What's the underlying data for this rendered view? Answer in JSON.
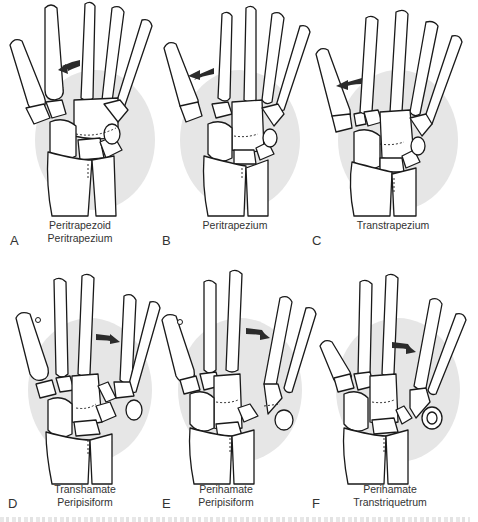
{
  "figure": {
    "panels": [
      {
        "id": "A",
        "letter": "A",
        "caption_line1": "Peritrapezoid",
        "caption_line2": "Peritrapezium",
        "arrow_direction": "left"
      },
      {
        "id": "B",
        "letter": "B",
        "caption_line1": "Peritrapezium",
        "caption_line2": "",
        "arrow_direction": "left"
      },
      {
        "id": "C",
        "letter": "C",
        "caption_line1": "Transtrapezium",
        "caption_line2": "",
        "arrow_direction": "left"
      },
      {
        "id": "D",
        "letter": "D",
        "caption_line1": "Transhamate",
        "caption_line2": "Peripisiform",
        "arrow_direction": "right"
      },
      {
        "id": "E",
        "letter": "E",
        "caption_line1": "Perihamate",
        "caption_line2": "Peripisiform",
        "arrow_direction": "right"
      },
      {
        "id": "F",
        "letter": "F",
        "caption_line1": "Perihamate",
        "caption_line2": "Transtriquetrum",
        "arrow_direction": "right"
      }
    ]
  },
  "colors": {
    "bone_outline": "#1a1a1a",
    "bone_fill": "#ffffff",
    "shadow": "#e6e6e6",
    "arrow": "#2b2b2b",
    "label_text": "#333333"
  }
}
